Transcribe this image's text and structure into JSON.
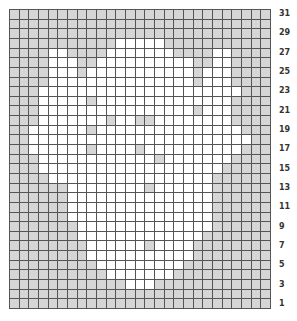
{
  "chart": {
    "columns": 27,
    "rows": 31,
    "colors": {
      "background_stitch": "#d6d6d6",
      "pattern_stitch": "#ffffff",
      "grid_line": "#555555"
    },
    "legend": {
      ".": "background (gray)",
      "o": "pattern (white)"
    },
    "grid_top_to_bottom": [
      "...........................",
      "...........................",
      "...........................",
      "...........ooooo...........",
      "....oo....ooooooo....oo....",
      "....ooo..oooooooooo..oo....",
      "....ooo.ooooooooooo.ooo....",
      "....ooooooooooooooo.ooo....",
      "...ooooooooooooooooooooo...",
      "...ooooo.oooooooooooooo....",
      "...oooooooooooooooo.ooo....",
      "...ooooooo.oo..oooooooo....",
      "..oooooo.ooooooooooooooo...",
      "..ooooooooooooooooooooooo..",
      "..oooooo.oooo.oooooooooo...",
      "...oooooooooooo.ooooooo....",
      "...ooooooooooooooooooo.....",
      "....ooooooooooooooooo......",
      "......oooooooo.oooooo......",
      "......ooooooooooooooo......",
      "......ooooooooooooooo......",
      "......ooooooooooooooo......",
      ".......oooooooooooooo......",
      ".......ooooooooooooo.......",
      "........oooooo.oooo........",
      "........ooooooooooo........",
      ".........ooooooooo.........",
      "..........ooooooo..........",
      "............ooo............",
      "...........................",
      "..........................."
    ],
    "row_labels": [
      "31",
      "29",
      "27",
      "25",
      "23",
      "21",
      "19",
      "17",
      "15",
      "13",
      "11",
      "9",
      "7",
      "5",
      "3",
      "1"
    ]
  }
}
